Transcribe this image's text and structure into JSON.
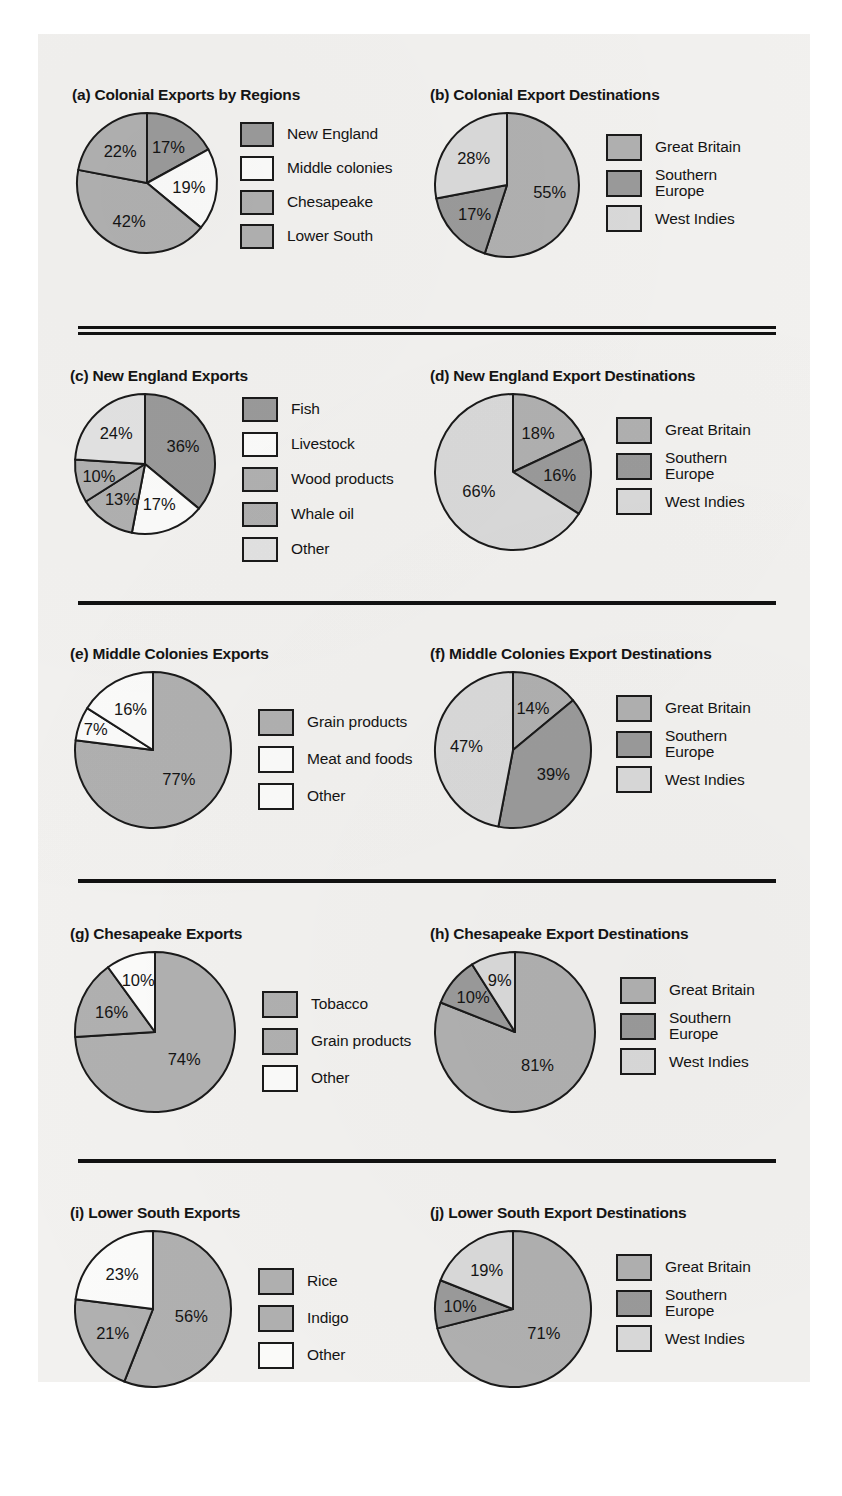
{
  "page": {
    "background": "#f2f1ef",
    "outline_color": "#111111"
  },
  "palette": {
    "dark_gray": "#9a9a9a",
    "medium_gray": "#b0b0b0",
    "light_gray": "#d9d9d9",
    "white": "#fbfbfa",
    "stroke": "#1a1a1a"
  },
  "dividers": [
    {
      "name": "divider-1",
      "style": "double"
    },
    {
      "name": "divider-2",
      "style": "single"
    },
    {
      "name": "divider-3",
      "style": "single"
    },
    {
      "name": "divider-4",
      "style": "single"
    }
  ],
  "charts": [
    {
      "id": "a",
      "title": "(a) Colonial Exports by Regions",
      "chart_data": {
        "type": "pie",
        "title": "(a) Colonial Exports by Regions",
        "unit": "%",
        "start_angle_deg": 0,
        "direction": "clockwise",
        "legend_position": "right",
        "categories": [
          "New England",
          "Middle colonies",
          "Chesapeake",
          "Lower South"
        ],
        "values": [
          17,
          19,
          42,
          22
        ],
        "labels": [
          "17%",
          "19%",
          "42%",
          "22%"
        ],
        "colors": [
          "#9a9a9a",
          "#fbfbfa",
          "#b0b0b0",
          "#b0b0b0"
        ]
      }
    },
    {
      "id": "b",
      "title": "(b) Colonial Export Destinations",
      "chart_data": {
        "type": "pie",
        "title": "(b) Colonial Export Destinations",
        "unit": "%",
        "start_angle_deg": 0,
        "direction": "clockwise",
        "legend_position": "right",
        "categories": [
          "Great Britain",
          "Southern\nEurope",
          "West Indies"
        ],
        "values": [
          55,
          17,
          28
        ],
        "labels": [
          "55%",
          "17%",
          "28%"
        ],
        "colors": [
          "#b0b0b0",
          "#9a9a9a",
          "#d9d9d9"
        ]
      }
    },
    {
      "id": "c",
      "title": "(c) New England Exports",
      "chart_data": {
        "type": "pie",
        "title": "(c) New England Exports",
        "unit": "%",
        "start_angle_deg": 0,
        "direction": "clockwise",
        "legend_position": "right",
        "categories": [
          "Fish",
          "Livestock",
          "Wood products",
          "Whale oil",
          "Other"
        ],
        "values": [
          36,
          17,
          13,
          10,
          24
        ],
        "labels": [
          "36%",
          "17%",
          "13%",
          "10%",
          "24%"
        ],
        "colors": [
          "#9a9a9a",
          "#fbfbfa",
          "#b0b0b0",
          "#b0b0b0",
          "#e2e2e2"
        ]
      }
    },
    {
      "id": "d",
      "title": "(d) New England Export Destinations",
      "chart_data": {
        "type": "pie",
        "title": "(d) New England Export Destinations",
        "unit": "%",
        "start_angle_deg": 0,
        "direction": "clockwise",
        "legend_position": "right",
        "categories": [
          "Great Britain",
          "Southern\nEurope",
          "West Indies"
        ],
        "values": [
          18,
          16,
          66
        ],
        "labels": [
          "18%",
          "16%",
          "66%"
        ],
        "colors": [
          "#b0b0b0",
          "#9a9a9a",
          "#d9d9d9"
        ]
      }
    },
    {
      "id": "e",
      "title": "(e) Middle Colonies Exports",
      "chart_data": {
        "type": "pie",
        "title": "(e) Middle Colonies Exports",
        "unit": "%",
        "start_angle_deg": 0,
        "direction": "clockwise",
        "legend_position": "right",
        "categories": [
          "Grain products",
          "Meat and foods",
          "Other"
        ],
        "values": [
          77,
          7,
          16
        ],
        "labels": [
          "77%",
          "7%",
          "16%"
        ],
        "colors": [
          "#b0b0b0",
          "#fbfbfa",
          "#fbfbfa"
        ]
      }
    },
    {
      "id": "f",
      "title": "(f) Middle Colonies Export Destinations",
      "chart_data": {
        "type": "pie",
        "title": "(f) Middle Colonies Export Destinations",
        "unit": "%",
        "start_angle_deg": 0,
        "direction": "clockwise",
        "legend_position": "right",
        "categories": [
          "Great Britain",
          "Southern\nEurope",
          "West Indies"
        ],
        "values": [
          14,
          39,
          47
        ],
        "labels": [
          "14%",
          "39%",
          "47%"
        ],
        "colors": [
          "#b0b0b0",
          "#9a9a9a",
          "#d9d9d9"
        ]
      }
    },
    {
      "id": "g",
      "title": "(g) Chesapeake Exports",
      "chart_data": {
        "type": "pie",
        "title": "(g) Chesapeake Exports",
        "unit": "%",
        "start_angle_deg": 0,
        "direction": "clockwise",
        "legend_position": "right",
        "categories": [
          "Tobacco",
          "Grain products",
          "Other"
        ],
        "values": [
          74,
          16,
          10
        ],
        "labels": [
          "74%",
          "16%",
          "10%"
        ],
        "colors": [
          "#b0b0b0",
          "#b0b0b0",
          "#fbfbfa"
        ]
      }
    },
    {
      "id": "h",
      "title": "(h) Chesapeake Export Destinations",
      "chart_data": {
        "type": "pie",
        "title": "(h) Chesapeake Export Destinations",
        "unit": "%",
        "start_angle_deg": 0,
        "direction": "clockwise",
        "legend_position": "right",
        "categories": [
          "Great Britain",
          "Southern\nEurope",
          "West Indies"
        ],
        "values": [
          81,
          10,
          9
        ],
        "labels": [
          "81%",
          "10%",
          "9%"
        ],
        "colors": [
          "#b0b0b0",
          "#9a9a9a",
          "#d9d9d9"
        ]
      }
    },
    {
      "id": "i",
      "title": "(i) Lower South Exports",
      "chart_data": {
        "type": "pie",
        "title": "(i) Lower South Exports",
        "unit": "%",
        "start_angle_deg": 0,
        "direction": "clockwise",
        "legend_position": "right",
        "categories": [
          "Rice",
          "Indigo",
          "Other"
        ],
        "values": [
          56,
          21,
          23
        ],
        "labels": [
          "56%",
          "21%",
          "23%"
        ],
        "colors": [
          "#b0b0b0",
          "#b0b0b0",
          "#fbfbfa"
        ]
      }
    },
    {
      "id": "j",
      "title": "(j) Lower South Export Destinations",
      "chart_data": {
        "type": "pie",
        "title": "(j) Lower South Export Destinations",
        "unit": "%",
        "start_angle_deg": 0,
        "direction": "clockwise",
        "legend_position": "right",
        "categories": [
          "Great Britain",
          "Southern\nEurope",
          "West Indies"
        ],
        "values": [
          71,
          10,
          19
        ],
        "labels": [
          "71%",
          "10%",
          "19%"
        ],
        "colors": [
          "#b0b0b0",
          "#9a9a9a",
          "#d9d9d9"
        ]
      }
    }
  ]
}
